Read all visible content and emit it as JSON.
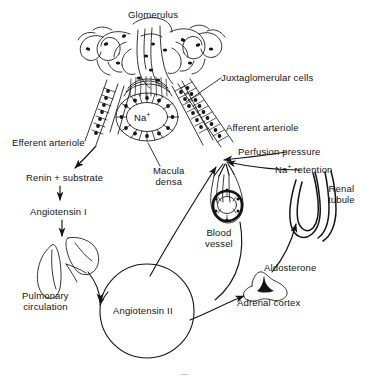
{
  "figure": {
    "background_color": "#ffffff",
    "ink_color": "#141414",
    "width": 369,
    "height": 376
  },
  "labels": {
    "glomerulus": "Glomerulus",
    "juxtaglomerular_cells": "Juxtaglomerular cells",
    "afferent_arteriole": "Afferent arteriole",
    "efferent_arteriole": "Efferent arteriole",
    "perfusion_pressure": "Perfusion pressure",
    "macula_densa": "Macula\ndensa",
    "sodium_ion": "Na",
    "sodium_ion_charge": "+",
    "sodium_retention_pre": "Na",
    "sodium_retention_charge": "+",
    "sodium_retention_post": " retention",
    "renal_tubule": "Renal\ntubule",
    "renin_substrate": "Renin + substrate",
    "angiotensin_i": "Angiotensin I",
    "angiotensin_ii": "Angiotensin II",
    "pulmonary_circulation": "Pulmonary\ncirculation",
    "blood_vessel": "Blood\nvessel",
    "aldosterone": "Aldosterone",
    "adrenal_cortex": "Adrenal cortex"
  },
  "structures": [
    {
      "name": "glomerulus-capillary-tuft",
      "kind": "anatomical-drawing"
    },
    {
      "name": "macula-densa-tubule",
      "kind": "anatomical-drawing"
    },
    {
      "name": "afferent-arteriole-vessel",
      "kind": "anatomical-drawing"
    },
    {
      "name": "efferent-arteriole-vessel",
      "kind": "anatomical-drawing"
    },
    {
      "name": "lungs-pulmonary-circulation",
      "kind": "anatomical-drawing"
    },
    {
      "name": "blood-vessel-cross-section",
      "kind": "anatomical-drawing"
    },
    {
      "name": "renal-tubule-loop",
      "kind": "anatomical-drawing"
    },
    {
      "name": "adrenal-cortex-gland",
      "kind": "anatomical-drawing"
    },
    {
      "name": "angiotensin-ii-pool-circle",
      "kind": "flow-node"
    }
  ],
  "flow_arrows": [
    {
      "from": "Efferent arteriole",
      "to": "Renin + substrate"
    },
    {
      "from": "Renin + substrate",
      "to": "Angiotensin I"
    },
    {
      "from": "Angiotensin I",
      "to": "Pulmonary circulation"
    },
    {
      "from": "Pulmonary circulation",
      "to": "Angiotensin II"
    },
    {
      "from": "Angiotensin II",
      "to": "Macula densa / afferent arteriole"
    },
    {
      "from": "Angiotensin II",
      "to": "Adrenal cortex"
    },
    {
      "from": "Adrenal cortex",
      "to": "Renal tubule (aldosterone)"
    },
    {
      "from": "Blood vessel",
      "to": "Angiotensin II"
    },
    {
      "from": "Perfusion pressure",
      "to": "Afferent arteriole"
    },
    {
      "from": "Na+ retention",
      "to": "Afferent arteriole"
    }
  ],
  "caption": {
    "partial_text": "—"
  }
}
